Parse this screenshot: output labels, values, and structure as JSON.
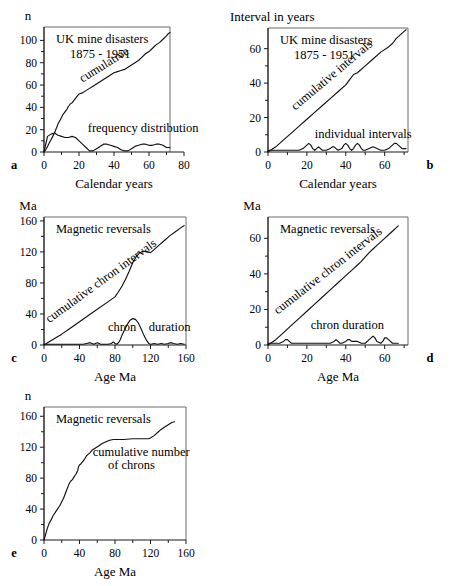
{
  "figure": {
    "panels": [
      {
        "letter": "a",
        "y_unit_label": "n",
        "xlabel": "Calendar years",
        "title_lines": [
          "UK mine disasters",
          "1875 - 1951"
        ],
        "annotations": [
          {
            "text": "cumulative",
            "x": 22,
            "y": 62,
            "rotate": -32
          },
          {
            "text": "frequency  distribution",
            "x": 25,
            "y": 18,
            "rotate": 0
          }
        ],
        "xticks": [
          0,
          20,
          40,
          60,
          80
        ],
        "xminor": [
          10,
          30,
          50,
          70
        ],
        "yticks": [
          0,
          20,
          40,
          60,
          80,
          100
        ],
        "yminor": [
          10,
          30,
          50,
          70,
          90
        ],
        "xlim": [
          0,
          80
        ],
        "ylim": [
          0,
          112
        ],
        "frame_xmax": 72
      },
      {
        "letter": "b",
        "y_unit_label": "Interval in years",
        "xlabel": "Calendar years",
        "title_lines": [
          "UK mine disasters",
          "1875 - 1951"
        ],
        "annotations": [
          {
            "text": "cumulative  intervals",
            "x": 14,
            "y": 24,
            "rotate": -40
          },
          {
            "text": "individual   intervals",
            "x": 24,
            "y": 8,
            "rotate": 0
          }
        ],
        "xticks": [
          0,
          20,
          40,
          60
        ],
        "xminor": [
          10,
          30,
          50,
          70
        ],
        "yticks": [
          0,
          20,
          40,
          60
        ],
        "yminor": [
          10,
          30,
          50
        ],
        "xlim": [
          0,
          72
        ],
        "ylim": [
          0,
          72
        ],
        "frame_xmax": 72
      },
      {
        "letter": "c",
        "y_unit_label": "Ma",
        "xlabel": "Age Ma",
        "title_lines": [
          "Magnetic reversals"
        ],
        "annotations": [
          {
            "text": "cumulative  chron  intervals",
            "x": 6,
            "y": 28,
            "rotate": -36
          },
          {
            "text": "chron",
            "x": 72,
            "y": 18,
            "rotate": 0
          },
          {
            "text": "duration",
            "x": 118,
            "y": 18,
            "rotate": 0
          }
        ],
        "xticks": [
          0,
          40,
          80,
          120,
          160
        ],
        "xminor": [
          20,
          60,
          100,
          140
        ],
        "yticks": [
          0,
          40,
          80,
          120,
          160
        ],
        "yminor": [
          20,
          60,
          100,
          140
        ],
        "xlim": [
          0,
          160
        ],
        "ylim": [
          0,
          165
        ],
        "frame_xmax": 160
      },
      {
        "letter": "d",
        "y_unit_label": "Ma",
        "xlabel": "Age Ma",
        "title_lines": [
          "Magnetic reversals"
        ],
        "annotations": [
          {
            "text": "cumulative  chron  intervals",
            "x": 5,
            "y": 17,
            "rotate": -38
          },
          {
            "text": "chron  duration",
            "x": 22,
            "y": 9,
            "rotate": 0
          }
        ],
        "xticks": [
          0,
          20,
          40,
          60
        ],
        "xminor": [
          10,
          30,
          50,
          70
        ],
        "yticks": [
          0,
          20,
          40,
          60
        ],
        "yminor": [
          10,
          30,
          50
        ],
        "xlim": [
          0,
          72
        ],
        "ylim": [
          0,
          72
        ],
        "frame_xmax": 72
      },
      {
        "letter": "e",
        "y_unit_label": "n",
        "xlabel": "Age Ma",
        "title_lines": [
          "Magnetic reversals"
        ],
        "annotations": [
          {
            "text": "cumulative  number",
            "x": 55,
            "y": 108,
            "rotate": 0
          },
          {
            "text": "of  chrons",
            "x": 72,
            "y": 92,
            "rotate": 0
          }
        ],
        "xticks": [
          0,
          40,
          80,
          120,
          160
        ],
        "xminor": [
          20,
          60,
          100,
          140
        ],
        "yticks": [
          0,
          40,
          80,
          120,
          160
        ],
        "yminor": [
          20,
          60,
          100,
          140
        ],
        "xlim": [
          0,
          160
        ],
        "ylim": [
          0,
          172
        ],
        "frame_xmax": 160
      }
    ]
  },
  "chart_data": [
    {
      "panel": "a",
      "type": "line",
      "title": "UK mine disasters 1875 - 1951",
      "xlabel": "Calendar years",
      "ylabel": "n",
      "xlim": [
        0,
        80
      ],
      "ylim": [
        0,
        112
      ],
      "grid": false,
      "legend": "inline-annotations",
      "series": [
        {
          "name": "cumulative",
          "x": [
            0,
            1,
            2,
            3,
            4,
            5,
            6,
            7,
            8,
            9,
            10,
            11,
            12,
            13,
            14,
            15,
            16,
            17,
            18,
            19,
            20,
            22,
            24,
            26,
            28,
            30,
            32,
            34,
            36,
            38,
            40,
            42,
            44,
            46,
            48,
            50,
            52,
            54,
            56,
            58,
            60,
            62,
            64,
            66,
            68,
            70,
            71,
            72
          ],
          "y": [
            0,
            2,
            5,
            8,
            11,
            14,
            17,
            21,
            25,
            28,
            31,
            34,
            36,
            38,
            41,
            43,
            44,
            46,
            48,
            50,
            52,
            53,
            55,
            57,
            59,
            61,
            63,
            65,
            67,
            69,
            71,
            72,
            73,
            74,
            76,
            78,
            80,
            82,
            85,
            88,
            90,
            93,
            96,
            98,
            101,
            104,
            106,
            107
          ]
        },
        {
          "name": "frequency distribution",
          "x": [
            0,
            2,
            4,
            6,
            8,
            10,
            12,
            14,
            16,
            18,
            20,
            22,
            24,
            26,
            28,
            30,
            32,
            34,
            36,
            38,
            40,
            42,
            44,
            46,
            48,
            50,
            52,
            54,
            56,
            58,
            60,
            62,
            64,
            66,
            68,
            70,
            72
          ],
          "y": [
            0,
            14,
            16,
            17,
            15,
            14,
            13,
            13,
            14,
            13,
            10,
            7,
            4,
            1,
            1,
            3,
            5,
            7,
            7,
            6,
            5,
            4,
            2,
            1,
            1,
            3,
            5,
            6,
            7,
            7,
            6,
            6,
            7,
            7,
            6,
            4,
            4
          ]
        }
      ]
    },
    {
      "panel": "b",
      "type": "line",
      "title": "UK mine disasters 1875 - 1951",
      "xlabel": "Calendar years",
      "ylabel": "Interval in years",
      "xlim": [
        0,
        72
      ],
      "ylim": [
        0,
        72
      ],
      "grid": false,
      "legend": "inline-annotations",
      "series": [
        {
          "name": "cumulative intervals",
          "x": [
            0,
            4,
            8,
            12,
            16,
            20,
            24,
            28,
            32,
            36,
            40,
            42,
            44,
            46,
            50,
            54,
            58,
            62,
            64,
            66,
            68,
            70,
            71
          ],
          "y": [
            0,
            3,
            7,
            11,
            15,
            19,
            23,
            27,
            31,
            35,
            39,
            42,
            45,
            46,
            50,
            54,
            58,
            61,
            63,
            66,
            68,
            70,
            71
          ]
        },
        {
          "name": "individual intervals",
          "x": [
            0,
            2,
            4,
            6,
            8,
            10,
            12,
            14,
            16,
            18,
            19,
            20,
            21,
            22,
            23,
            24,
            25,
            26,
            27,
            28,
            30,
            32,
            33,
            34,
            35,
            36,
            38,
            39,
            40,
            41,
            42,
            43,
            44,
            45,
            46,
            47,
            48,
            49,
            50,
            52,
            54,
            56,
            58,
            60,
            62,
            63,
            64,
            65,
            66,
            67,
            68,
            69,
            70,
            71
          ],
          "y": [
            1,
            1,
            1,
            1,
            1,
            1,
            1,
            1,
            1,
            2,
            3,
            4,
            5,
            4,
            2,
            1,
            2,
            3,
            2,
            1,
            1,
            2,
            3,
            3,
            2,
            1,
            2,
            4,
            5,
            4,
            2,
            1,
            2,
            4,
            5,
            4,
            2,
            1,
            1,
            2,
            3,
            2,
            1,
            1,
            2,
            3,
            4,
            5,
            5,
            4,
            3,
            2,
            2,
            2
          ]
        }
      ]
    },
    {
      "panel": "c",
      "type": "line",
      "title": "Magnetic reversals",
      "xlabel": "Age Ma",
      "ylabel": "Ma",
      "xlim": [
        0,
        160
      ],
      "ylim": [
        0,
        165
      ],
      "grid": false,
      "legend": "inline-annotations",
      "series": [
        {
          "name": "cumulative chron intervals",
          "x": [
            0,
            10,
            20,
            30,
            40,
            50,
            60,
            70,
            80,
            83,
            88,
            92,
            96,
            100,
            104,
            108,
            112,
            116,
            120,
            124,
            130,
            136,
            142,
            148,
            154,
            158
          ],
          "y": [
            0,
            7,
            14,
            22,
            30,
            38,
            46,
            54,
            62,
            67,
            76,
            85,
            95,
            106,
            114,
            119,
            121,
            120,
            119,
            123,
            129,
            135,
            141,
            146,
            151,
            154
          ]
        },
        {
          "name": "chron duration",
          "x": [
            0,
            4,
            8,
            12,
            16,
            20,
            24,
            28,
            32,
            36,
            40,
            44,
            48,
            52,
            54,
            56,
            58,
            60,
            62,
            64,
            66,
            68,
            72,
            76,
            78,
            80,
            82,
            84,
            86,
            88,
            91,
            94,
            97,
            100,
            103,
            106,
            109,
            112,
            115,
            118,
            120,
            121,
            124,
            128,
            132,
            136,
            140,
            143,
            146,
            150,
            154,
            158
          ],
          "y": [
            1,
            1,
            1,
            1,
            1,
            1,
            1,
            1,
            1,
            1,
            1,
            1,
            2,
            3,
            2,
            1,
            2,
            3,
            2,
            1,
            1,
            1,
            1,
            2,
            4,
            2,
            1,
            3,
            7,
            13,
            20,
            27,
            32,
            34,
            33,
            29,
            22,
            14,
            7,
            2,
            1,
            1,
            2,
            1,
            2,
            1,
            2,
            3,
            2,
            1,
            2,
            1
          ]
        }
      ]
    },
    {
      "panel": "d",
      "type": "line",
      "title": "Magnetic reversals",
      "xlabel": "Age Ma",
      "ylabel": "Ma",
      "xlim": [
        0,
        72
      ],
      "ylim": [
        0,
        72
      ],
      "grid": false,
      "legend": "inline-annotations",
      "series": [
        {
          "name": "cumulative chron intervals",
          "x": [
            0,
            4,
            8,
            12,
            16,
            20,
            24,
            28,
            32,
            36,
            40,
            44,
            46,
            48,
            52,
            54,
            56,
            58,
            60,
            62,
            64,
            66,
            67
          ],
          "y": [
            0,
            3,
            7,
            11,
            15,
            19,
            23,
            27,
            31,
            35,
            39,
            43,
            45,
            47,
            52,
            54,
            56,
            58,
            60,
            62,
            64,
            66,
            67
          ]
        },
        {
          "name": "chron duration",
          "x": [
            0,
            2,
            4,
            6,
            8,
            9,
            10,
            11,
            12,
            14,
            16,
            18,
            20,
            22,
            24,
            26,
            28,
            30,
            32,
            34,
            35,
            36,
            37,
            38,
            40,
            41,
            42,
            43,
            44,
            45,
            46,
            48,
            50,
            52,
            53,
            54,
            55,
            56,
            58,
            59,
            60,
            61,
            62,
            63,
            64,
            66,
            67
          ],
          "y": [
            1,
            1,
            1,
            1,
            2,
            3,
            3,
            2,
            1,
            1,
            1,
            1,
            1,
            1,
            1,
            1,
            1,
            1,
            1,
            2,
            3,
            2,
            1,
            1,
            2,
            3,
            3,
            2,
            2,
            2,
            2,
            1,
            1,
            3,
            4,
            5,
            4,
            2,
            1,
            2,
            4,
            4,
            3,
            2,
            1,
            1,
            1
          ]
        }
      ]
    },
    {
      "panel": "e",
      "type": "line",
      "title": "Magnetic reversals",
      "xlabel": "Age Ma",
      "ylabel": "n",
      "xlim": [
        0,
        160
      ],
      "ylim": [
        0,
        172
      ],
      "grid": false,
      "legend": "inline-annotations",
      "series": [
        {
          "name": "cumulative number of chrons",
          "x": [
            0,
            2,
            4,
            6,
            8,
            10,
            14,
            18,
            22,
            26,
            28,
            30,
            32,
            34,
            36,
            38,
            39,
            40,
            42,
            44,
            46,
            48,
            50,
            52,
            54,
            58,
            62,
            66,
            70,
            74,
            78,
            80,
            84,
            90,
            100,
            110,
            118,
            120,
            124,
            128,
            132,
            136,
            140,
            144,
            147
          ],
          "y": [
            0,
            8,
            16,
            22,
            26,
            31,
            38,
            45,
            54,
            66,
            72,
            76,
            78,
            82,
            85,
            90,
            95,
            97,
            99,
            102,
            105,
            109,
            111,
            113,
            116,
            119,
            122,
            125,
            127,
            129,
            130,
            130,
            130,
            130,
            131,
            131,
            131,
            132,
            135,
            139,
            143,
            146,
            149,
            152,
            153
          ]
        }
      ]
    }
  ]
}
